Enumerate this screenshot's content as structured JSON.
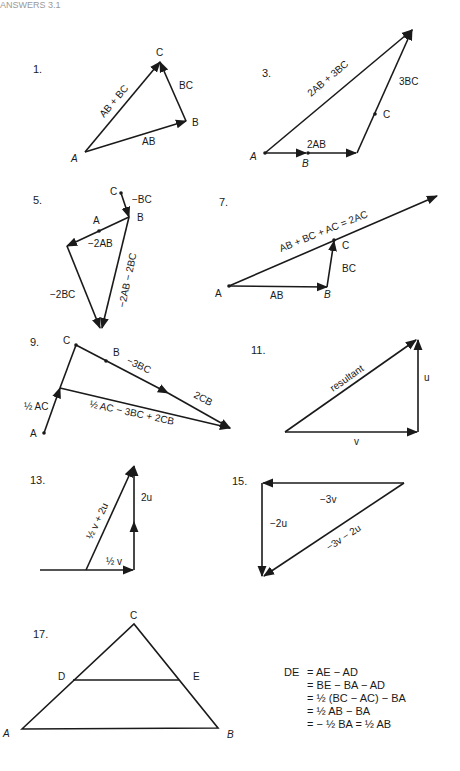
{
  "header_fragment": "ANSWERS 3.1",
  "colors": {
    "ink": "#1a1a1a",
    "background": "#ffffff"
  },
  "problems": [
    {
      "number": "1.",
      "points": {
        "A": "A",
        "B": "B",
        "C": "C"
      },
      "vectors": {
        "ab": "AB",
        "bc": "BC",
        "sum": "AB + BC"
      }
    },
    {
      "number": "3.",
      "points": {
        "A": "A",
        "B": "B",
        "C": "C"
      },
      "vectors": {
        "ab": "2AB",
        "bc": "3BC",
        "sum": "2AB + 3BC"
      }
    },
    {
      "number": "5.",
      "points": {
        "A": "A",
        "B": "B",
        "C": "C"
      },
      "vectors": {
        "bc": "−BC",
        "ab": "−2AB",
        "bc2": "−2BC",
        "sum": "−2AB − 2BC"
      }
    },
    {
      "number": "7.",
      "points": {
        "A": "A",
        "B": "B",
        "C": "C"
      },
      "vectors": {
        "ab": "AB",
        "bc": "BC",
        "sum": "AB + BC + AC = 2AC"
      }
    },
    {
      "number": "9.",
      "points": {
        "A": "A",
        "B": "B",
        "C": "C"
      },
      "vectors": {
        "ac": "½ AC",
        "bc": "−3BC",
        "cb": "2CB",
        "sum": "½ AC − 3BC + 2CB"
      }
    },
    {
      "number": "11.",
      "vectors": {
        "u": "u",
        "v": "v",
        "sum": "resultant"
      }
    },
    {
      "number": "13.",
      "vectors": {
        "u": "2u",
        "v": "½ v",
        "sum": "½ v + 2u"
      }
    },
    {
      "number": "15.",
      "vectors": {
        "v": "−3v",
        "u": "−2u",
        "sum": "−3v − 2u"
      }
    },
    {
      "number": "17.",
      "points": {
        "A": "A",
        "B": "B",
        "C": "C",
        "D": "D",
        "E": "E"
      }
    }
  ],
  "derivation": {
    "lhs": "DE",
    "lines": [
      "= AE − AD",
      "= BE − BA − AD",
      "= ½ (BC − AC) − BA",
      "= ½ AB − BA",
      "= − ½ BA = ½ AB"
    ]
  }
}
